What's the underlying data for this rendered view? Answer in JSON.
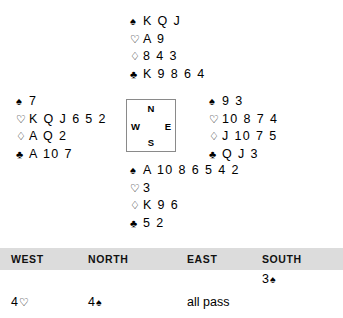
{
  "deal": {
    "north": {
      "label": "North",
      "rows": [
        {
          "suit": "spade-symbol",
          "glyph": "♠",
          "style": "black",
          "cards": "K Q J"
        },
        {
          "suit": "heart-symbol",
          "glyph": "♡",
          "style": "hollow",
          "cards": "A 9"
        },
        {
          "suit": "diamond-symbol",
          "glyph": "♢",
          "style": "hollow",
          "cards": "8 4 3"
        },
        {
          "suit": "club-symbol",
          "glyph": "♣",
          "style": "black",
          "cards": "K 9 8 6 4"
        }
      ]
    },
    "west": {
      "label": "West",
      "rows": [
        {
          "suit": "spade-symbol",
          "glyph": "♠",
          "style": "black",
          "cards": "7"
        },
        {
          "suit": "heart-symbol",
          "glyph": "♡",
          "style": "hollow",
          "cards": "K Q J 6 5 2"
        },
        {
          "suit": "diamond-symbol",
          "glyph": "♢",
          "style": "hollow",
          "cards": "A Q 2"
        },
        {
          "suit": "club-symbol",
          "glyph": "♣",
          "style": "black",
          "cards": "A 10 7"
        }
      ]
    },
    "east": {
      "label": "East",
      "rows": [
        {
          "suit": "spade-symbol",
          "glyph": "♠",
          "style": "black",
          "cards": "9 3"
        },
        {
          "suit": "heart-symbol",
          "glyph": "♡",
          "style": "hollow",
          "cards": "10 8 7 4"
        },
        {
          "suit": "diamond-symbol",
          "glyph": "♢",
          "style": "hollow",
          "cards": "J 10 7 5"
        },
        {
          "suit": "club-symbol",
          "glyph": "♣",
          "style": "black",
          "cards": "Q J 3"
        }
      ]
    },
    "south": {
      "label": "South",
      "rows": [
        {
          "suit": "spade-symbol",
          "glyph": "♠",
          "style": "black",
          "cards": "A 10 8 6 5 4 2"
        },
        {
          "suit": "heart-symbol",
          "glyph": "♡",
          "style": "hollow",
          "cards": "3"
        },
        {
          "suit": "diamond-symbol",
          "glyph": "♢",
          "style": "hollow",
          "cards": "K 9 6"
        },
        {
          "suit": "club-symbol",
          "glyph": "♣",
          "style": "black",
          "cards": "5 2"
        }
      ]
    }
  },
  "compass": {
    "north": "N",
    "south": "S",
    "west": "W",
    "east": "E"
  },
  "bidding": {
    "headers": {
      "west": "WEST",
      "north": "NORTH",
      "east": "EAST",
      "south": "SOUTH"
    },
    "rows": [
      {
        "west": "",
        "north": "",
        "east": "",
        "south_level": "3",
        "south_suit": "♠"
      },
      {
        "west_level": "4",
        "west_suit": "♡",
        "north_level": "4",
        "north_suit": "♠",
        "east": "all pass",
        "south": ""
      }
    ]
  },
  "colors": {
    "header_band": "#dcdcdc",
    "text": "#000000",
    "box_border": "#8a8a8a",
    "background": "#ffffff"
  }
}
